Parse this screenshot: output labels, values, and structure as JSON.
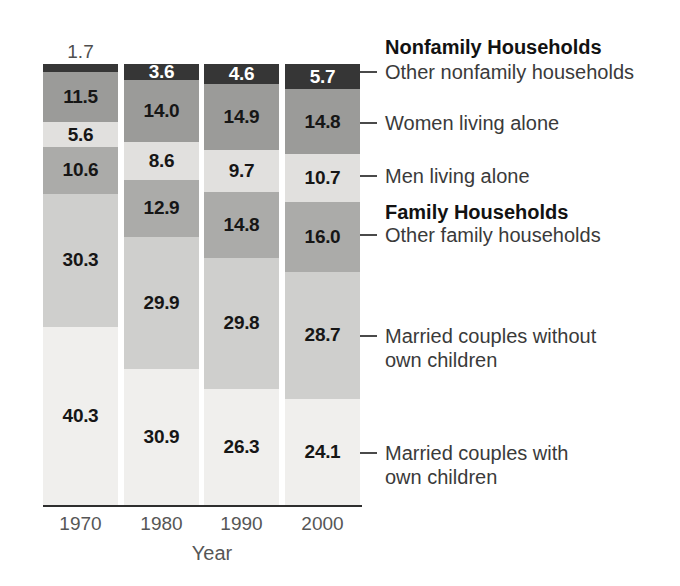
{
  "chart_data": {
    "type": "bar",
    "stacked": true,
    "percent_of_total": true,
    "xlabel": "Year",
    "categories": [
      "1970",
      "1980",
      "1990",
      "2000"
    ],
    "series": [
      {
        "key": "married-couples-with-own-children",
        "name": "Married couples with own children",
        "color": "#f0efed",
        "label_color": "#161616",
        "values": [
          40.3,
          30.9,
          26.3,
          24.1
        ]
      },
      {
        "key": "married-couples-without-own-children",
        "name": "Married couples without own children",
        "color": "#cfcfcd",
        "label_color": "#161616",
        "values": [
          30.3,
          29.9,
          29.8,
          28.7
        ]
      },
      {
        "key": "other-family-households",
        "name": "Other family households",
        "color": "#ababa9",
        "label_color": "#161616",
        "values": [
          10.6,
          12.9,
          14.8,
          16.0
        ]
      },
      {
        "key": "men-living-alone",
        "name": "Men living alone",
        "color": "#e1e0de",
        "label_color": "#161616",
        "values": [
          5.6,
          8.6,
          9.7,
          10.7
        ]
      },
      {
        "key": "women-living-alone",
        "name": "Women living alone",
        "color": "#9b9b99",
        "label_color": "#161616",
        "values": [
          11.5,
          14.0,
          14.9,
          14.8
        ]
      },
      {
        "key": "other-nonfamily-households",
        "name": "Other nonfamily households",
        "color": "#363636",
        "label_color": "#ffffff",
        "values": [
          1.7,
          3.6,
          4.6,
          5.7
        ]
      }
    ],
    "outside_label_color": "#4e4e4e",
    "axis_color": "#2e2e2e",
    "tick_label_color": "#565656",
    "legend_position": "right"
  },
  "legend": {
    "nonfamily_header": "Nonfamily Households",
    "family_header": "Family Households",
    "entries": [
      {
        "line1": "Other nonfamily households",
        "line2": ""
      },
      {
        "line1": "Women living alone",
        "line2": ""
      },
      {
        "line1": "Men living alone",
        "line2": ""
      },
      {
        "line1": "Other family households",
        "line2": ""
      },
      {
        "line1": "Married couples without",
        "line2": "own children"
      },
      {
        "line1": "Married couples with",
        "line2": "own children"
      }
    ]
  }
}
